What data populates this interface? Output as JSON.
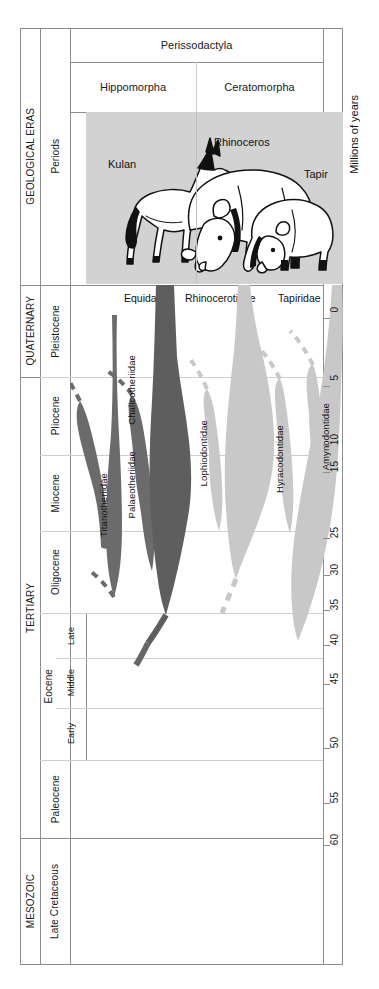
{
  "headers": {
    "order": "Perissodactyla",
    "suborders": [
      "Hippomorpha",
      "Ceratomorpha"
    ],
    "eras_axis": "GEOLOGICAL ERAS",
    "periods_axis": "Periods",
    "time_axis": "Millions of years"
  },
  "illustration": {
    "captions": [
      "Kulan",
      "Rhinoceros",
      "Tapir"
    ],
    "background_color": "#d2d2d2"
  },
  "family_headers": [
    "Equidae",
    "Rhinocerotidae",
    "Tapiridae"
  ],
  "clades": [
    {
      "name": "Titanotheriidae",
      "group": "Hippomorpha",
      "color": "#6b6b6b"
    },
    {
      "name": "Chalicotheriidae",
      "group": "Hippomorpha",
      "color": "#6b6b6b"
    },
    {
      "name": "Palaeotheriidae",
      "group": "Hippomorpha",
      "color": "#6b6b6b"
    },
    {
      "name": "Equidae",
      "group": "Hippomorpha",
      "color": "#5e5e5e"
    },
    {
      "name": "Lophiodontidae",
      "group": "Ceratomorpha",
      "color": "#c8c8c8"
    },
    {
      "name": "Rhinocerotidae",
      "group": "Ceratomorpha",
      "color": "#c8c8c8"
    },
    {
      "name": "Hyracodontidae",
      "group": "Ceratomorpha",
      "color": "#c8c8c8"
    },
    {
      "name": "Amynodontidae",
      "group": "Ceratomorpha",
      "color": "#c8c8c8"
    },
    {
      "name": "Tapiridae",
      "group": "Ceratomorpha",
      "color": "#c8c8c8"
    }
  ],
  "eras": [
    {
      "label": "QUATERNARY",
      "top": 285,
      "height": 92
    },
    {
      "label": "TERTIARY",
      "top": 377,
      "height": 461
    },
    {
      "label": "MESOZOIC",
      "top": 838,
      "height": 127
    }
  ],
  "periods": [
    {
      "label": "Pleistocene",
      "top": 285,
      "height": 92
    },
    {
      "label": "Pliocene",
      "top": 377,
      "height": 78
    },
    {
      "label": "Miocene",
      "top": 455,
      "height": 76
    },
    {
      "label": "Oligocene",
      "top": 531,
      "height": 82
    },
    {
      "label": "Eocene",
      "top": 613,
      "height": 147
    },
    {
      "label": "Paleocene",
      "top": 760,
      "height": 78
    },
    {
      "label": "Late\nCretaceous",
      "top": 838,
      "height": 127
    }
  ],
  "epoch_subdivisions": [
    {
      "label": "Late",
      "top": 613,
      "height": 45
    },
    {
      "label": "Middle",
      "top": 658,
      "height": 50
    },
    {
      "label": "Early",
      "top": 708,
      "height": 52
    }
  ],
  "chart_data": {
    "type": "area",
    "ylabel": "Millions of years",
    "yaxis_ticks": [
      0,
      5,
      10,
      15,
      25,
      30,
      35,
      40,
      45,
      50,
      55,
      60
    ],
    "ylim": [
      0,
      65
    ],
    "axis_direction": "top-to-bottom (present at top)",
    "grid": true,
    "legend": "none",
    "series": [
      {
        "name": "Titanotheriidae",
        "group": "Hippomorpha",
        "color": "#6b6b6b",
        "range_mya": [
          55,
          33
        ],
        "peak_width": "medium",
        "status": "extinct"
      },
      {
        "name": "Chalicotheriidae",
        "group": "Hippomorpha",
        "color": "#6b6b6b",
        "range_mya": [
          55,
          2
        ],
        "peak_width": "narrow",
        "status": "extinct"
      },
      {
        "name": "Palaeotheriidae",
        "group": "Hippomorpha",
        "color": "#6b6b6b",
        "range_mya": [
          55,
          28
        ],
        "peak_width": "medium",
        "status": "extinct"
      },
      {
        "name": "Equidae",
        "group": "Hippomorpha",
        "color": "#5e5e5e",
        "range_mya": [
          58,
          0
        ],
        "peak_width": "wide",
        "status": "extant"
      },
      {
        "name": "Lophiodontidae",
        "group": "Ceratomorpha",
        "color": "#c8c8c8",
        "range_mya": [
          52,
          38
        ],
        "peak_width": "narrow",
        "status": "extinct"
      },
      {
        "name": "Rhinocerotidae",
        "group": "Ceratomorpha",
        "color": "#c8c8c8",
        "range_mya": [
          50,
          0
        ],
        "peak_width": "wide",
        "status": "extant"
      },
      {
        "name": "Hyracodontidae",
        "group": "Ceratomorpha",
        "color": "#c8c8c8",
        "range_mya": [
          52,
          28
        ],
        "peak_width": "narrow",
        "status": "extinct"
      },
      {
        "name": "Amynodontidae",
        "group": "Ceratomorpha",
        "color": "#c8c8c8",
        "range_mya": [
          52,
          25
        ],
        "peak_width": "narrow",
        "status": "extinct"
      },
      {
        "name": "Tapiridae",
        "group": "Ceratomorpha",
        "color": "#c8c8c8",
        "range_mya": [
          55,
          0
        ],
        "peak_width": "medium",
        "status": "extant"
      }
    ],
    "root_mya": 62,
    "note": "Dashed stems indicate inferred/uncertain ancestry converging on a common Paleocene root."
  }
}
